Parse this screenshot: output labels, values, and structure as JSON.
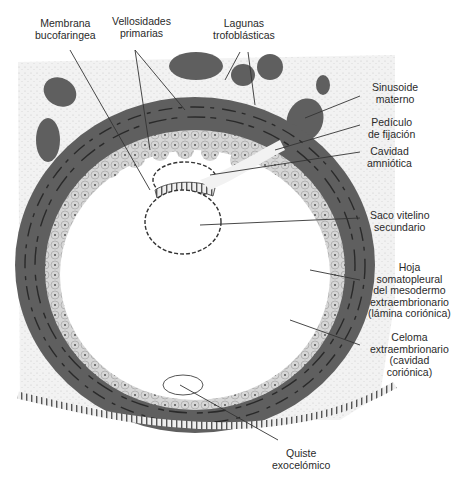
{
  "figure": {
    "type": "embryology-diagram",
    "colors": {
      "background": "#ffffff",
      "maternal_tissue": "#f1f1f1",
      "syncytiotrophoblast": "#5f5f5f",
      "lacunae_outline": "#2a2a2a",
      "cytotrophoblast": "#d2d2d2",
      "extraembryonic_mesoderm": "#f6f6f6",
      "leader_line": "#333333",
      "text": "#2a2a2a"
    }
  },
  "labels": {
    "membrana_bucofaringea": {
      "line1": "Membrana",
      "line2": "bucofaringea"
    },
    "vellosidades_primarias": {
      "line1": "Vellosidades",
      "line2": "primarias"
    },
    "lagunas_trofoblasticas": {
      "line1": "Lagunas",
      "line2": "trofoblásticas"
    },
    "sinusoide_materno": {
      "line1": "Sinusoide",
      "line2": "materno"
    },
    "pediculo_fijacion": {
      "line1": "Pedículo",
      "line2": "de fijación"
    },
    "cavidad_amniotica": {
      "line1": "Cavidad",
      "line2": "amniótica"
    },
    "saco_vitelino": {
      "line1": "Saco vitelino",
      "line2": "secundario"
    },
    "hoja_somatopleural": {
      "line1": "Hoja",
      "line2": "somatopleural",
      "line3": "del mesodermo",
      "line4": "extraembrionario",
      "line5": "(lámina coriónica)"
    },
    "celoma": {
      "line1": "Celoma",
      "line2": "extraembrionario",
      "line3": "(cavidad",
      "line4": "coriónica)"
    },
    "quiste_exocelomico": {
      "line1": "Quiste",
      "line2": "exocelómico"
    }
  }
}
